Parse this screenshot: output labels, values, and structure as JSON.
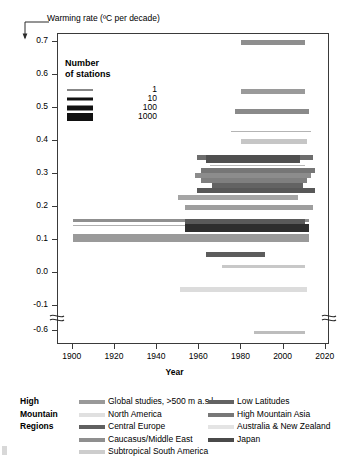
{
  "figure": {
    "y_axis_title": "Warming rate (ºC per decade)",
    "x_axis_title": "Year"
  },
  "station_legend": {
    "title_line1": "Number",
    "title_line2": "of stations",
    "entries": [
      {
        "label": "1",
        "thickness": 1
      },
      {
        "label": "10",
        "thickness": 3
      },
      {
        "label": "100",
        "thickness": 5
      },
      {
        "label": "1000",
        "thickness": 8
      }
    ]
  },
  "region_legend": {
    "heading_lines": [
      "High",
      "Mountain",
      "Regions"
    ],
    "column1": [
      {
        "label": "Global studies, >500 m a.s.l.",
        "color": "#999999"
      },
      {
        "label": "North America",
        "color": "#e0e0e0"
      },
      {
        "label": "Central Europe",
        "color": "#606060"
      },
      {
        "label": "Caucasus/Middle East",
        "color": "#8f8f8f"
      },
      {
        "label": "Subtropical South America",
        "color": "#cdcdcd"
      }
    ],
    "column2": [
      {
        "label": "Low Latitudes",
        "color": "#636363"
      },
      {
        "label": "High Mountain Asia",
        "color": "#777777"
      },
      {
        "label": "Australia & New Zealand",
        "color": "#e4e4e4"
      },
      {
        "label": "Japan",
        "color": "#4a4a4a"
      }
    ]
  },
  "chart_data": {
    "type": "bar",
    "orientation": "horizontal-span",
    "title": "",
    "xlabel": "Year",
    "ylabel": "Warming rate (ºC per decade)",
    "xlim": [
      1893,
      2022
    ],
    "xticks": [
      1900,
      1920,
      1940,
      1960,
      1980,
      2000,
      2020
    ],
    "yticks": [
      0.7,
      0.6,
      0.5,
      0.4,
      0.3,
      0.2,
      0.1,
      0.0,
      -0.1,
      -0.6
    ],
    "y_axis_break": {
      "between": [
        -0.1,
        -0.6
      ],
      "present": true
    },
    "grid": false,
    "legend_position": "bottom",
    "encoding": {
      "bar_thickness": "number of stations",
      "bar_color": "high mountain region"
    },
    "bars": [
      {
        "region": "High Mountain Asia",
        "color": "#8e8e8e",
        "start_year": 1980,
        "end_year": 2010,
        "value": 0.7,
        "stations": 100
      },
      {
        "region": "High Mountain Asia",
        "color": "#9a9a9a",
        "start_year": 1980,
        "end_year": 2010,
        "value": 0.55,
        "stations": 100
      },
      {
        "region": "High Mountain Asia",
        "color": "#8a8a8a",
        "start_year": 1977,
        "end_year": 2012,
        "value": 0.49,
        "stations": 100
      },
      {
        "region": "Global studies, >500 m a.s.l.",
        "color": "#b4b4b4",
        "start_year": 1975,
        "end_year": 2013,
        "value": 0.43,
        "stations": 1
      },
      {
        "region": "Subtropical South America",
        "color": "#c6c6c6",
        "start_year": 1980,
        "end_year": 2011,
        "value": 0.4,
        "stations": 100
      },
      {
        "region": "Low Latitudes",
        "color": "#6d6d6d",
        "start_year": 1959,
        "end_year": 2014,
        "value": 0.35,
        "stations": 100
      },
      {
        "region": "Central Europe",
        "color": "#4f4f4f",
        "start_year": 1963,
        "end_year": 2008,
        "value": 0.345,
        "stations": 1000
      },
      {
        "region": "Global studies, >500 m a.s.l.",
        "color": "#b8b8b8",
        "start_year": 1965,
        "end_year": 2010,
        "value": 0.325,
        "stations": 1
      },
      {
        "region": "Low Latitudes",
        "color": "#767676",
        "start_year": 1961,
        "end_year": 2015,
        "value": 0.31,
        "stations": 100
      },
      {
        "region": "Caucasus/Middle East",
        "color": "#8c8c8c",
        "start_year": 1958,
        "end_year": 2013,
        "value": 0.295,
        "stations": 100
      },
      {
        "region": "High Mountain Asia",
        "color": "#7f7f7f",
        "start_year": 1961,
        "end_year": 2011,
        "value": 0.28,
        "stations": 100
      },
      {
        "region": "Low Latitudes",
        "color": "#636363",
        "start_year": 1966,
        "end_year": 2009,
        "value": 0.265,
        "stations": 100
      },
      {
        "region": "Central Europe",
        "color": "#585858",
        "start_year": 1959,
        "end_year": 2015,
        "value": 0.25,
        "stations": 100
      },
      {
        "region": "Caucasus/Middle East",
        "color": "#a5a5a5",
        "start_year": 1950,
        "end_year": 2007,
        "value": 0.23,
        "stations": 100
      },
      {
        "region": "Global studies, >500 m a.s.l.",
        "color": "#9e9e9e",
        "start_year": 1953,
        "end_year": 2014,
        "value": 0.2,
        "stations": 100
      },
      {
        "region": "Global studies, >500 m a.s.l.",
        "color": "#8f8f8f",
        "start_year": 1900,
        "end_year": 2012,
        "value": 0.16,
        "stations": 10
      },
      {
        "region": "Global studies, >500 m a.s.l.",
        "color": "#b0b0b0",
        "start_year": 1900,
        "end_year": 2009,
        "value": 0.145,
        "stations": 1
      },
      {
        "region": "Central Europe",
        "color": "#5a5a5a",
        "start_year": 1953,
        "end_year": 2010,
        "value": 0.152,
        "stations": 1000
      },
      {
        "region": "Japan",
        "color": "#2e2e2e",
        "start_year": 1953,
        "end_year": 2012,
        "value": 0.135,
        "stations": 1000
      },
      {
        "region": "Global studies, >500 m a.s.l.",
        "color": "#9a9a9a",
        "start_year": 1900,
        "end_year": 2012,
        "value": 0.105,
        "stations": 1000
      },
      {
        "region": "Central Europe",
        "color": "#5c5c5c",
        "start_year": 1963,
        "end_year": 1991,
        "value": 0.055,
        "stations": 100
      },
      {
        "region": "Australia & New Zealand",
        "color": "#c8c8c8",
        "start_year": 1971,
        "end_year": 2010,
        "value": 0.02,
        "stations": 10
      },
      {
        "region": "North America",
        "color": "#dcdcdc",
        "start_year": 1951,
        "end_year": 2011,
        "value": -0.05,
        "stations": 100
      },
      {
        "region": "North America",
        "color": "#bdbdbd",
        "start_year": 1986,
        "end_year": 2010,
        "value": -0.65,
        "stations": 10
      }
    ]
  }
}
